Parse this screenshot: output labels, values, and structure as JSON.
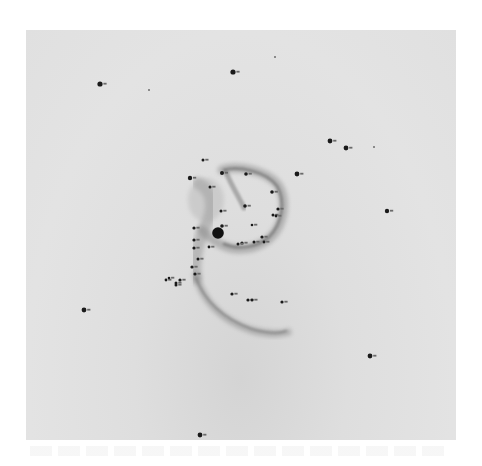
{
  "figure": {
    "star_count": 46,
    "colors": {
      "background": "#e0e0e0",
      "nebula": "#9a9a9a",
      "star": "#1a1a1a",
      "central_star": "#111111"
    }
  }
}
